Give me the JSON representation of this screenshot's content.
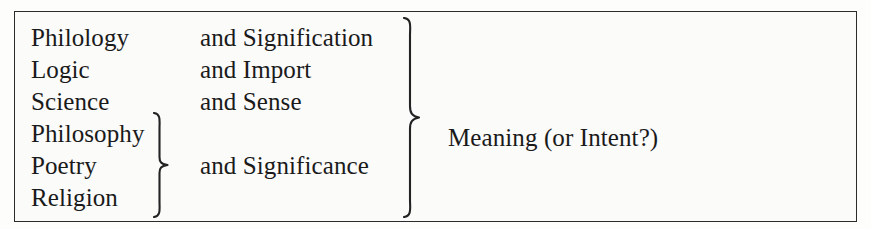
{
  "figure": {
    "rows": [
      {
        "term": "Philology",
        "pairing": "and Signification"
      },
      {
        "term": "Logic",
        "pairing": "and Import"
      },
      {
        "term": "Science",
        "pairing": "and Sense"
      },
      {
        "term": "Philosophy",
        "pairing": ""
      },
      {
        "term": "Poetry",
        "pairing": "and Significance"
      },
      {
        "term": "Religion",
        "pairing": ""
      }
    ],
    "result_label": "Meaning (or Intent?)",
    "braces": {
      "inner": "right-curly-brace",
      "outer": "right-curly-brace"
    },
    "colors": {
      "ink": "#1a1a1a",
      "rule": "#2b2b2b",
      "paper": "#fbfbfa"
    }
  }
}
